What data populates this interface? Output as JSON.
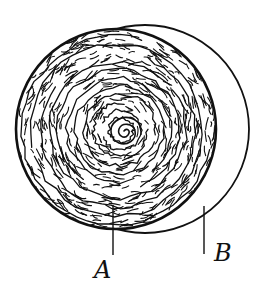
{
  "diagram": {
    "type": "sketch",
    "colors": {
      "ink": "#111111",
      "background": "#ffffff"
    },
    "shapes": {
      "inner_disc": {
        "cx": 116,
        "cy": 129,
        "r": 100,
        "fill": "hatched-spiral"
      },
      "outer_circle": {
        "cx": 145,
        "cy": 129,
        "r": 104,
        "fill": "none"
      }
    },
    "labels": [
      {
        "id": "A",
        "text": "A",
        "leader": {
          "x": 113,
          "y1": 205,
          "y2": 255
        }
      },
      {
        "id": "B",
        "text": "B",
        "leader": {
          "x": 204,
          "y1": 206,
          "y2": 254
        }
      }
    ]
  }
}
